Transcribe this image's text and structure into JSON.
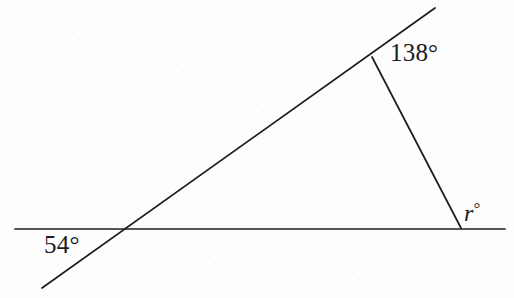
{
  "figure": {
    "type": "geometry-diagram",
    "background_color": "#fdfdfd",
    "stroke_color": "#1c1c1c",
    "labels": {
      "top_angle": "138°",
      "left_angle": "54°",
      "right_angle": "r",
      "right_angle_degree_symbol": "°"
    },
    "geometry": {
      "horizontal_line": {
        "x1": 15,
        "y1": 229,
        "x2": 505,
        "y2": 229
      },
      "transversal_line": {
        "x1": 42,
        "y1": 288,
        "x2": 435,
        "y2": 8
      },
      "short_segment": {
        "x1": 372,
        "y1": 57,
        "x2": 461,
        "y2": 228
      },
      "vertices": {
        "left_intersection": {
          "x": 128,
          "y": 230
        },
        "top_vertex": {
          "x": 372,
          "y": 57
        },
        "right_vertex": {
          "x": 461,
          "y": 228
        }
      }
    }
  },
  "chart_data": {
    "type": "diagram",
    "title": "",
    "annotations": [
      {
        "label": "138°",
        "value": 138,
        "at": "top vertex, interior-right of upper slanted line"
      },
      {
        "label": "54°",
        "value": 54,
        "at": "left intersection, below horizontal line to the left"
      },
      {
        "label": "r°",
        "value": null,
        "at": "right vertex, above horizontal line"
      }
    ]
  }
}
